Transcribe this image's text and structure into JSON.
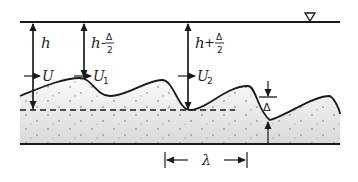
{
  "diagram": {
    "water_surface_symbol": "∇",
    "depth_labels": [
      {
        "id": "h",
        "main": "h",
        "op": "",
        "frac_num": "",
        "frac_den": ""
      },
      {
        "id": "h_minus",
        "main": "h",
        "op": "-",
        "frac_num": "Δ",
        "frac_den": "2"
      },
      {
        "id": "h_plus",
        "main": "h",
        "op": "+",
        "frac_num": "Δ",
        "frac_den": "2"
      }
    ],
    "velocity_labels": [
      {
        "id": "U",
        "main": "U",
        "sub": ""
      },
      {
        "id": "U1",
        "main": "U",
        "sub": "1"
      },
      {
        "id": "U2",
        "main": "U",
        "sub": "2"
      }
    ],
    "bedform_height_label": "Δ",
    "wavelength_label": "λ",
    "colors": {
      "line": "#1a1a1a",
      "sediment_top": "#f7f7f7",
      "sediment_bottom": "#dcdcdc",
      "dots": "#888888"
    }
  }
}
